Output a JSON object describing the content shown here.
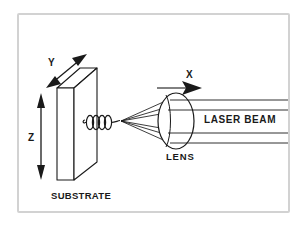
{
  "figure": {
    "type": "technical-schematic",
    "background_color": "#ffffff",
    "line_color": "#1a1a1a",
    "border_color": "#d2d2d2"
  },
  "axes": [
    {
      "name": "x-axis",
      "label": "X",
      "arrow": "single",
      "direction": "right"
    },
    {
      "name": "y-axis",
      "label": "Y",
      "arrow": "double",
      "direction": "diagonal-up-right"
    },
    {
      "name": "z-axis",
      "label": "Z",
      "arrow": "double",
      "direction": "vertical"
    }
  ],
  "parts": [
    {
      "name": "substrate",
      "label": "SUBSTRATE"
    },
    {
      "name": "lens",
      "label": "LENS"
    },
    {
      "name": "laser-beam",
      "label": "LASER BEAM"
    }
  ],
  "labels": {
    "x": "X",
    "y": "Y",
    "z": "Z",
    "substrate": "SUBSTRATE",
    "lens": "LENS",
    "laser_beam": "LASER BEAM"
  }
}
